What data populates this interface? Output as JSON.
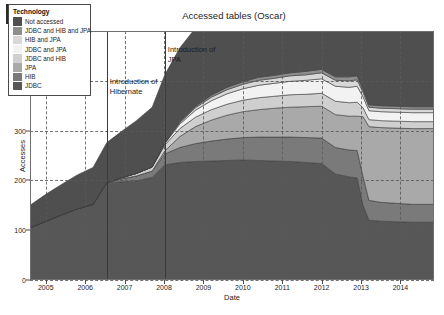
{
  "figure": {
    "panel_label": "(a)",
    "title": "Accessed tables (Oscar)"
  },
  "legend": {
    "title": "Technology",
    "entries": [
      {
        "label": "Not accessed",
        "color": "#4f4f4f"
      },
      {
        "label": "JDBC and HIB and JPA",
        "color": "#8e8e8e"
      },
      {
        "label": "HIB and JPA",
        "color": "#d8d8d8"
      },
      {
        "label": "JDBC and JPA",
        "color": "#f2f2f2"
      },
      {
        "label": "JDBC and HIB",
        "color": "#cfcfcf"
      },
      {
        "label": "JPA",
        "color": "#a9a9a9"
      },
      {
        "label": "HIB",
        "color": "#7a7a7a"
      },
      {
        "label": "JDBC",
        "color": "#575757"
      }
    ]
  },
  "annotations": [
    {
      "text": "Introduction of Hibernate",
      "x_value": 2006.55
    },
    {
      "text": "Introduction of JPA",
      "x_value": 2008.02
    }
  ],
  "chart_data": {
    "type": "area",
    "title": "Accessed tables (Oscar)",
    "xlabel": "Date",
    "ylabel": "Accesses",
    "xlim": [
      2004.6,
      2014.85
    ],
    "ylim": [
      0,
      500
    ],
    "yticks": [
      0,
      100,
      200,
      300,
      400,
      500
    ],
    "xticks": [
      2005,
      2006,
      2007,
      2008,
      2009,
      2010,
      2011,
      2012,
      2013,
      2014
    ],
    "grid": true,
    "stacked": true,
    "legend_position": "top-left",
    "x": [
      2004.6,
      2005.0,
      2005.4,
      2005.8,
      2006.2,
      2006.55,
      2006.9,
      2007.3,
      2007.7,
      2008.02,
      2008.4,
      2008.8,
      2009.2,
      2009.6,
      2010.0,
      2010.4,
      2010.8,
      2011.2,
      2011.6,
      2012.0,
      2012.35,
      2012.7,
      2012.9,
      2013.05,
      2013.2,
      2013.5,
      2013.9,
      2014.3,
      2014.85
    ],
    "series": [
      {
        "name": "JDBC",
        "color": "#575757",
        "values": [
          105,
          118,
          131,
          143,
          152,
          196,
          197,
          199,
          206,
          231,
          236,
          238,
          239,
          240,
          241,
          240,
          239,
          238,
          236,
          234,
          213,
          207,
          205,
          150,
          120,
          118,
          117,
          116,
          116
        ]
      },
      {
        "name": "HIB",
        "color": "#7a7a7a",
        "values": [
          0,
          0,
          0,
          0,
          0,
          0,
          6,
          10,
          13,
          22,
          30,
          36,
          40,
          43,
          45,
          47,
          48,
          49,
          50,
          51,
          53,
          54,
          55,
          58,
          40,
          38,
          37,
          36,
          36
        ]
      },
      {
        "name": "JPA",
        "color": "#a9a9a9",
        "values": [
          0,
          0,
          0,
          0,
          0,
          0,
          0,
          0,
          0,
          6,
          22,
          34,
          42,
          48,
          52,
          55,
          58,
          60,
          62,
          64,
          66,
          68,
          69,
          120,
          148,
          150,
          151,
          152,
          152
        ]
      },
      {
        "name": "JDBC and HIB",
        "color": "#cfcfcf",
        "values": [
          0,
          0,
          0,
          0,
          0,
          0,
          2,
          5,
          8,
          12,
          16,
          19,
          21,
          22,
          23,
          24,
          24,
          25,
          25,
          26,
          27,
          27,
          28,
          18,
          14,
          14,
          14,
          14,
          14
        ]
      },
      {
        "name": "JDBC and JPA",
        "color": "#f2f2f2",
        "values": [
          0,
          0,
          0,
          0,
          0,
          0,
          0,
          0,
          0,
          3,
          9,
          14,
          18,
          21,
          23,
          25,
          26,
          27,
          28,
          29,
          30,
          31,
          32,
          22,
          18,
          18,
          18,
          18,
          18
        ]
      },
      {
        "name": "HIB and JPA",
        "color": "#d8d8d8",
        "values": [
          0,
          0,
          0,
          0,
          0,
          0,
          0,
          0,
          0,
          1,
          3,
          5,
          7,
          8,
          9,
          10,
          10,
          11,
          11,
          12,
          12,
          13,
          13,
          9,
          7,
          7,
          7,
          7,
          7
        ]
      },
      {
        "name": "JDBC and HIB and JPA",
        "color": "#8e8e8e",
        "values": [
          0,
          0,
          0,
          0,
          0,
          0,
          0,
          0,
          0,
          1,
          2,
          3,
          4,
          5,
          5,
          6,
          6,
          6,
          7,
          7,
          7,
          8,
          8,
          6,
          5,
          5,
          5,
          5,
          5
        ]
      },
      {
        "name": "Not accessed",
        "color": "#4f4f4f",
        "values": [
          45,
          54,
          61,
          68,
          74,
          80,
          92,
          106,
          120,
          136,
          148,
          157,
          164,
          170,
          176,
          181,
          187,
          192,
          197,
          203,
          208,
          212,
          215,
          218,
          222,
          229,
          237,
          245,
          152
        ]
      }
    ]
  }
}
